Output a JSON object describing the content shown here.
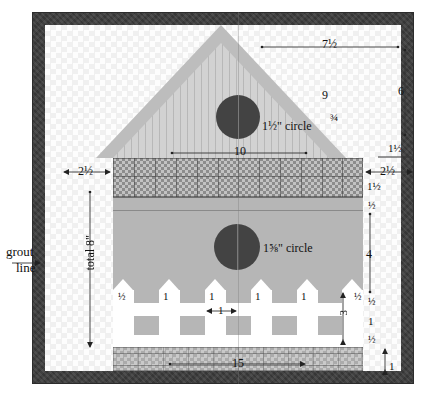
{
  "diagram": {
    "grout_label_line1": "grout",
    "grout_label_line2": "line",
    "gable_circle_label": "1½\" circle",
    "wall_circle_label": "1⅝\" circle",
    "total_height_label": "total 8\"",
    "colors": {
      "frame": "#3d3d3d",
      "background": "#fafafa",
      "roof_overhang": "#b9b9b9",
      "gable_fill": "#cfcfcf",
      "wall": "#b6b6b6",
      "tile_band": "#9a9a9a",
      "base": "#b9b9b9",
      "picket": "#ffffff",
      "circle": "#434343",
      "dimension_text": "#111111"
    }
  },
  "dimensions": {
    "top_right_horizontal": "7½",
    "right_upper_vertical": "6",
    "roof_slope": "9",
    "roof_thickness": "¾",
    "gable_base_width": "10",
    "right_overhang": "1½",
    "left_margin": "2½",
    "right_margin": "2½",
    "band_height": "1½",
    "wall_top_strip": "½",
    "wall_main": "4",
    "picket_top_gap": "½",
    "rail_upper": "1",
    "rail_lower": "½",
    "base_height": "1",
    "bottom_width": "15",
    "total_height": "total 8\""
  },
  "fence": {
    "gap_labels": [
      "½",
      "1",
      "1",
      "1",
      "1",
      "½"
    ],
    "picket_width_label": "1",
    "picket_height_label": "3",
    "picket_count": 6
  }
}
